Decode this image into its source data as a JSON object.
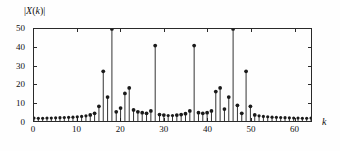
{
  "figure": {
    "background": "#ffffff",
    "stem_color": "#1a1a1a",
    "axis_color": "#2a2a2a"
  },
  "labels": {
    "ylabel": "|X(k)|",
    "ylabel_mag_open": "|",
    "ylabel_X": "X",
    "ylabel_paren_open": "(",
    "ylabel_k": "k",
    "ylabel_paren_close": ")",
    "ylabel_mag_close": "|",
    "xlabel": "k"
  },
  "chart_data": {
    "type": "bar",
    "title": "",
    "subtitle": "",
    "xlabel": "k",
    "ylabel": "|X(k)|",
    "xlim": [
      0,
      64
    ],
    "ylim": [
      0,
      50
    ],
    "grid": false,
    "legend": null,
    "xticks": [
      0,
      10,
      20,
      30,
      40,
      50,
      60
    ],
    "xtick_labels": [
      "0",
      "10",
      "20",
      "30",
      "40",
      "50",
      "60"
    ],
    "yticks": [
      0,
      10,
      20,
      30,
      40,
      50
    ],
    "ytick_labels": [
      "0",
      "10",
      "20",
      "30",
      "40",
      "50"
    ],
    "marker": "filled-circle",
    "categories": [
      0,
      1,
      2,
      3,
      4,
      5,
      6,
      7,
      8,
      9,
      10,
      11,
      12,
      13,
      14,
      15,
      16,
      17,
      18,
      19,
      20,
      21,
      22,
      23,
      24,
      25,
      26,
      27,
      28,
      29,
      30,
      31,
      32,
      33,
      34,
      35,
      36,
      37,
      38,
      39,
      40,
      41,
      42,
      43,
      44,
      45,
      46,
      47,
      48,
      49,
      50,
      51,
      52,
      53,
      54,
      55,
      56,
      57,
      58,
      59,
      60,
      61,
      62,
      63,
      64
    ],
    "values": [
      1.6,
      1.5,
      1.5,
      1.6,
      1.6,
      1.7,
      1.8,
      1.9,
      2.0,
      2.1,
      2.3,
      2.5,
      2.8,
      3.3,
      4.2,
      8.0,
      27.0,
      13.0,
      50.0,
      5.0,
      7.0,
      15.0,
      18.0,
      6.0,
      5.0,
      4.5,
      4.2,
      5.5,
      41.0,
      3.5,
      3.2,
      3.0,
      3.0,
      3.2,
      3.5,
      4.0,
      5.5,
      41.0,
      4.5,
      4.2,
      4.5,
      5.5,
      16.0,
      18.0,
      6.5,
      13.0,
      50.0,
      8.5,
      4.2,
      27.0,
      8.0,
      3.3,
      2.8,
      2.5,
      2.3,
      2.1,
      2.0,
      1.9,
      1.8,
      1.7,
      1.6,
      1.6,
      1.5,
      1.5,
      1.6
    ]
  }
}
